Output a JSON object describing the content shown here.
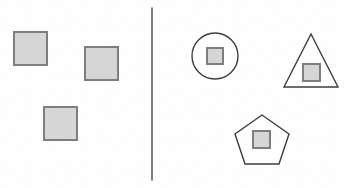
{
  "figure": {
    "width": 350,
    "height": 188,
    "background_color": "#fefefe"
  },
  "colors": {
    "square_fill": "#d6d6d6",
    "square_stroke": "#7e7e7e",
    "outline_shape_stroke": "#3d3d3d",
    "outline_shape_fill": "none",
    "divider_color": "#4a4a4a",
    "background": "#fefefe"
  },
  "divider": {
    "label": "panel-divider",
    "x": 152,
    "y_start": 8,
    "y_end": 180,
    "stroke_width": 1.4
  },
  "left_panel": {
    "label": "Left panel",
    "shape_count": 3,
    "shapes": [
      {
        "name": "square-1",
        "type": "square",
        "x": 14,
        "y": 32,
        "size": 33,
        "fill": "#d6d6d6",
        "stroke": "#7e7e7e",
        "stroke_width": 2,
        "contains": "none"
      },
      {
        "name": "square-2",
        "type": "square",
        "x": 85,
        "y": 47,
        "size": 33,
        "fill": "#d6d6d6",
        "stroke": "#7e7e7e",
        "stroke_width": 2,
        "contains": "none"
      },
      {
        "name": "square-3",
        "type": "square",
        "x": 44,
        "y": 107,
        "size": 33,
        "fill": "#d6d6d6",
        "stroke": "#7e7e7e",
        "stroke_width": 2,
        "contains": "none"
      }
    ]
  },
  "right_panel": {
    "label": "Right panel",
    "shape_count": 3,
    "shapes": [
      {
        "name": "circle-with-square",
        "type": "circle",
        "center_x": 215,
        "center_y": 56,
        "radius": 23,
        "stroke": "#3d3d3d",
        "stroke_width": 1.4,
        "inner_square": {
          "name": "inner-square-circle",
          "x": 207,
          "y": 48,
          "size": 16,
          "fill": "#d6d6d6",
          "stroke": "#7e7e7e",
          "stroke_width": 2
        }
      },
      {
        "name": "triangle-with-square",
        "type": "triangle",
        "points": "311,34 338,87 284,87",
        "stroke": "#3d3d3d",
        "stroke_width": 1.4,
        "inner_square": {
          "name": "inner-square-triangle",
          "x": 303,
          "y": 64,
          "size": 17,
          "fill": "#d6d6d6",
          "stroke": "#7e7e7e",
          "stroke_width": 2
        }
      },
      {
        "name": "pentagon-with-square",
        "type": "pentagon",
        "points": "262,115 289,134 279,164 245,164 235,134",
        "stroke": "#3d3d3d",
        "stroke_width": 1.4,
        "inner_square": {
          "name": "inner-square-pentagon",
          "x": 253,
          "y": 131,
          "size": 17,
          "fill": "#d6d6d6",
          "stroke": "#7e7e7e",
          "stroke_width": 2
        }
      }
    ]
  }
}
